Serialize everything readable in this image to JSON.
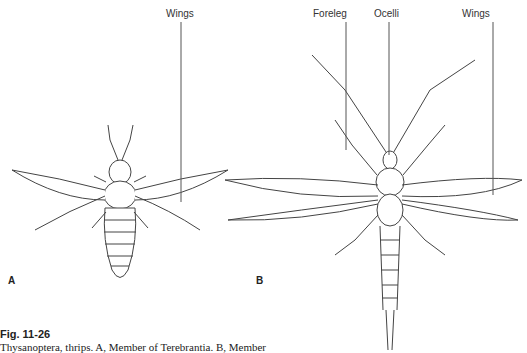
{
  "figure": {
    "labels": {
      "wings_a": "Wings",
      "foreleg": "Foreleg",
      "ocelli": "Ocelli",
      "wings_b": "Wings"
    },
    "panels": [
      "A",
      "B"
    ],
    "caption": {
      "title": "Fig. 11-26",
      "text": "Thysanoptera, thrips. A, Member of Terebrantia. B, Member"
    }
  }
}
